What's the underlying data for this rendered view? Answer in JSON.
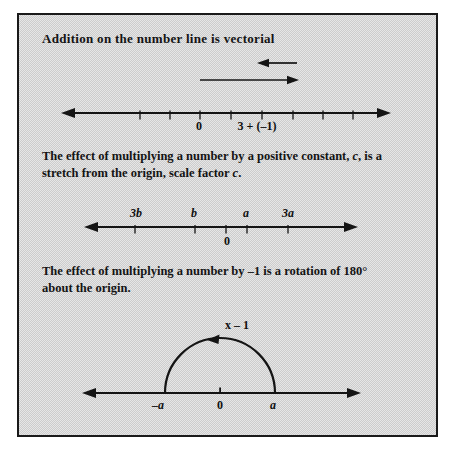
{
  "figure": {
    "paper_color": "#ffffff",
    "panel_color": "#d8d8d8",
    "frame_border_color": "#1a1a1a",
    "ink_color": "#141414",
    "sections": {
      "s1": {
        "heading": "Addition on the number line is vectorial",
        "labels": {
          "zero": "0",
          "sum": "3 + (–1)"
        }
      },
      "s2": {
        "heading_line1": [
          "The effect of multiplying a number by a positive constant, ",
          "c",
          ", is a"
        ],
        "heading_line2": [
          "stretch from the origin, scale factor ",
          "c",
          "."
        ],
        "labels": {
          "three_b": "3b",
          "b": "b",
          "a": "a",
          "three_a": "3a",
          "zero": "0"
        }
      },
      "s3": {
        "heading_line1": "The effect of multiplying a number by –1 is a rotation of 180°",
        "heading_line2": "about the origin.",
        "labels": {
          "arc": "x – 1",
          "neg_a": "–a",
          "zero": "0",
          "a": "a"
        }
      }
    }
  }
}
